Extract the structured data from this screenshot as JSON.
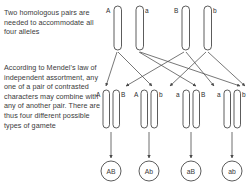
{
  "figure": {
    "paragraphs": {
      "p1": "Two homologous pairs are needed to accommodate all four alleles",
      "p2": "According to Mendel's law of independent assortment, any one of a pair of contrasted characters may combine with any of another pair. There are thus four different possible types of gamete"
    },
    "colors": {
      "outline": "#4a4a4a",
      "text": "#3a3a3a",
      "background": "#ffffff"
    },
    "parent_row": {
      "caption": "parent homologous chromosome pairs",
      "chromosomes": [
        {
          "allele": "A",
          "label_side": "left"
        },
        {
          "allele": "a",
          "label_side": "right"
        },
        {
          "allele": "B",
          "label_side": "left"
        },
        {
          "allele": "b",
          "label_side": "right"
        }
      ]
    },
    "gamete_row": {
      "caption": "segregated chromosomes in four gamete groups",
      "groups": [
        {
          "alleles": [
            "A",
            "A",
            "B"
          ],
          "labels": [
            "A",
            "A",
            "B"
          ]
        },
        {
          "alleles": [
            "A",
            "A",
            "b"
          ],
          "labels": [
            "A",
            "A",
            "b"
          ]
        },
        {
          "alleles": [
            "a",
            "a",
            "B"
          ],
          "labels": [
            "a",
            "a",
            "B"
          ]
        },
        {
          "alleles": [
            "a",
            "a",
            "b"
          ],
          "labels": [
            "a",
            "a",
            "b"
          ]
        }
      ]
    },
    "gametes": {
      "caption": "four possible gamete types",
      "items": [
        {
          "genotype": "AB"
        },
        {
          "genotype": "Ab"
        },
        {
          "genotype": "aB"
        },
        {
          "genotype": "ab"
        }
      ]
    }
  }
}
